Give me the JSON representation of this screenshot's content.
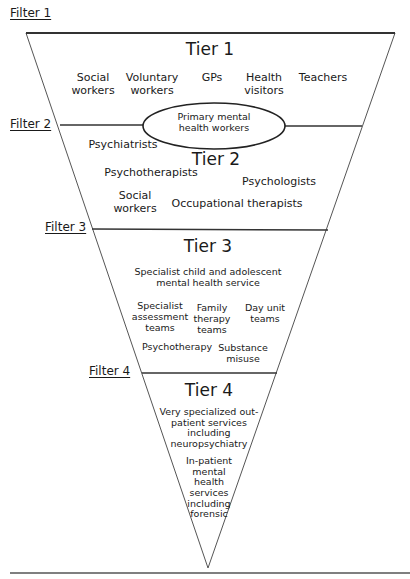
{
  "filters": [
    {
      "label": "Filter 1"
    },
    {
      "label": "Filter 2"
    },
    {
      "label": "Filter 3"
    },
    {
      "label": "Filter 4"
    }
  ],
  "tier1": {
    "title": "Tier 1",
    "items": [
      {
        "line1": "Social",
        "line2": "workers"
      },
      {
        "line1": "Voluntary",
        "line2": "workers"
      },
      {
        "line1": "GPs",
        "line2": ""
      },
      {
        "line1": "Health",
        "line2": "visitors"
      },
      {
        "line1": "Teachers",
        "line2": ""
      }
    ]
  },
  "ellipse": {
    "line1": "Primary mental",
    "line2": "health workers"
  },
  "tier2": {
    "title": "Tier 2",
    "items": [
      {
        "line1": "Psychiatrists"
      },
      {
        "line1": "Psychotherapists"
      },
      {
        "line1": "Psychologists"
      },
      {
        "line1": "Social",
        "line2": "workers"
      },
      {
        "line1": "Occupational therapists"
      }
    ]
  },
  "tier3": {
    "title": "Tier 3",
    "subtitle_line1": "Specialist child and adolescent",
    "subtitle_line2": "mental health service",
    "items": [
      {
        "line1": "Specialist",
        "line2": "assessment",
        "line3": "teams"
      },
      {
        "line1": "Family",
        "line2": "therapy",
        "line3": "teams"
      },
      {
        "line1": "Day unit",
        "line2": "teams"
      },
      {
        "line1": "Psychotherapy"
      },
      {
        "line1": "Substance",
        "line2": "misuse"
      }
    ]
  },
  "tier4": {
    "title": "Tier 4",
    "block1": [
      "Very specialized out-",
      "patient services",
      "including",
      "neuropsychiatry"
    ],
    "block2": [
      "In-patient",
      "mental",
      "health",
      "services",
      "including",
      "forensic"
    ]
  },
  "colors": {
    "line": "#333333",
    "funnel_edge": "#555555",
    "text": "#1a1a1a",
    "background": "#ffffff"
  }
}
